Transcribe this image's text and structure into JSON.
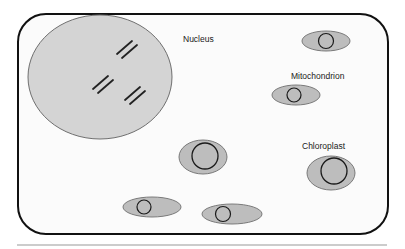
{
  "diagram": {
    "type": "cell-illustration",
    "colors": {
      "background": "#ffffff",
      "cell_fill": "#fbfbfb",
      "cell_stroke": "#111111",
      "nucleus_fill": "#d4d4d4",
      "nucleus_stroke": "#6f6f6f",
      "organelle_fill": "#bdbdbd",
      "organelle_stroke": "#7a7a7a",
      "inner_stroke": "#1a1a1a",
      "chromosome_stroke": "#222222",
      "rule_color": "#9a9a9a"
    },
    "labels": {
      "nucleus": "Nucleus",
      "mitochondrion": "Mitochondrion",
      "chloroplast": "Chloroplast"
    },
    "components": [
      {
        "name": "Cell membrane",
        "shape": "rounded-rectangle"
      },
      {
        "name": "Nucleus",
        "shape": "ellipse",
        "contains": "3 chromosome pairs"
      },
      {
        "name": "Organelle (top right)",
        "shape": "ellipse with inner circle"
      },
      {
        "name": "Mitochondrion",
        "shape": "ellipse with inner circle"
      },
      {
        "name": "Organelle (center)",
        "shape": "ellipse with inner circle"
      },
      {
        "name": "Chloroplast",
        "shape": "ellipse with inner circle"
      },
      {
        "name": "Organelle (bottom left)",
        "shape": "ellipse with inner circle"
      },
      {
        "name": "Organelle (bottom middle)",
        "shape": "ellipse with inner circle"
      }
    ]
  }
}
